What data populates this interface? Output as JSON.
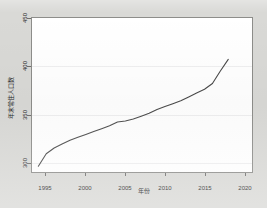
{
  "figure": {
    "background_color": "#d9d9d6",
    "plot_background_color": "#ffffff",
    "line_color": "#4a4a4a"
  },
  "chart_data": {
    "type": "line",
    "title": "",
    "xlabel": "年份",
    "ylabel": "年末常住人口数",
    "xlim": [
      1993.2,
      2021.0
    ],
    "ylim": [
      295,
      455
    ],
    "xticks": [
      1995,
      2000,
      2005,
      2010,
      2015,
      2020
    ],
    "xtick_labels": [
      "1995",
      "2000",
      "2005",
      "2010",
      "2015",
      "2020"
    ],
    "yticks": [
      300,
      350,
      400,
      450
    ],
    "ytick_labels": [
      "300",
      "350",
      "400",
      "450"
    ],
    "grid": "horizontal",
    "legend": null,
    "series": [
      {
        "name": "年末常住人口数",
        "x": [
          1994,
          1995,
          1996,
          1997,
          1998,
          1999,
          2000,
          2001,
          2002,
          2003,
          2004,
          2005,
          2006,
          2007,
          2008,
          2009,
          2010,
          2011,
          2012,
          2013,
          2014,
          2015,
          2016,
          2017,
          2018
        ],
        "values": [
          301,
          314,
          320,
          324,
          328,
          331,
          334,
          337,
          340,
          343,
          347,
          348,
          350,
          353,
          356,
          360,
          363,
          366,
          369,
          373,
          377,
          381,
          387,
          400,
          412
        ]
      }
    ]
  }
}
